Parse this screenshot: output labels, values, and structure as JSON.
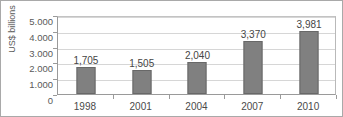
{
  "chart_data": {
    "type": "bar",
    "title": "",
    "xlabel": "",
    "ylabel": "US$ billions",
    "categories": [
      "1998",
      "2001",
      "2004",
      "2007",
      "2010"
    ],
    "values": [
      1705,
      1505,
      2040,
      3370,
      3981
    ],
    "value_labels": [
      "1,705",
      "1,505",
      "2,040",
      "3,370",
      "3,981"
    ],
    "ylim": [
      0,
      5000
    ],
    "ytick_values": [
      0,
      1000,
      2000,
      3000,
      4000,
      5000
    ],
    "ytick_labels": [
      "0",
      "1.000",
      "2.000",
      "3.000",
      "4.000",
      "5.000"
    ],
    "grid": true,
    "legend": false,
    "bar_color": "#808080",
    "bar_edge_color": "#686868",
    "gridline_color": "#d6d6d6",
    "axis_color": "#9a9a9a",
    "text_color": "#4a4a4a",
    "border_color": "#a9a9a9",
    "background_color": "#ffffff"
  }
}
